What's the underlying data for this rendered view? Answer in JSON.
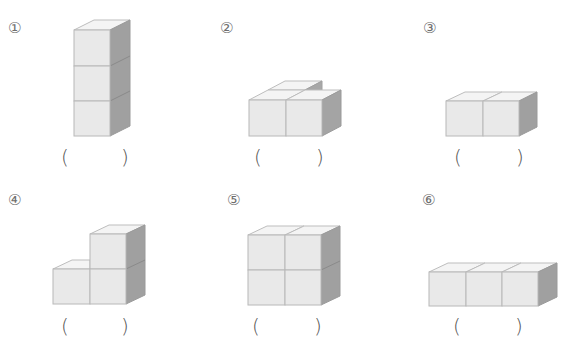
{
  "worksheet": {
    "problems": [
      {
        "number": "①",
        "open_paren": "(",
        "close_paren": ")",
        "answer": "",
        "shape": "vertical stack of 3 cubes"
      },
      {
        "number": "②",
        "open_paren": "(",
        "close_paren": ")",
        "answer": "",
        "shape": "L-shaped layer of 3 cubes"
      },
      {
        "number": "③",
        "open_paren": "(",
        "close_paren": ")",
        "answer": "",
        "shape": "row of 2 cubes"
      },
      {
        "number": "④",
        "open_paren": "(",
        "close_paren": ")",
        "answer": "",
        "shape": "step of 3 cubes"
      },
      {
        "number": "⑤",
        "open_paren": "(",
        "close_paren": ")",
        "answer": "",
        "shape": "2x2 square of 4 cubes"
      },
      {
        "number": "⑥",
        "open_paren": "(",
        "close_paren": ")",
        "answer": "",
        "shape": "row of 3 cubes"
      }
    ]
  },
  "colors": {
    "front": "#e8e8e8",
    "top": "#f4f4f4",
    "side": "#9e9e9e",
    "edge": "#b5b5b5"
  }
}
